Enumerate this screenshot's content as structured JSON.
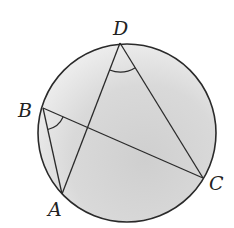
{
  "figure": {
    "type": "inscribed-angles",
    "circle": {
      "cx": 127,
      "cy": 133,
      "r": 89,
      "stroke": "#2a2a2a",
      "fill_shaded": "#d6d6d6",
      "fill_light": "#eeeeee"
    },
    "points": [
      {
        "id": "D",
        "label": "D",
        "x": 120,
        "y": 43,
        "lx": 113,
        "ly": 35
      },
      {
        "id": "B",
        "label": "B",
        "x": 43,
        "y": 108,
        "lx": 18,
        "ly": 117
      },
      {
        "id": "A",
        "label": "A",
        "x": 62,
        "y": 194,
        "lx": 48,
        "ly": 216
      },
      {
        "id": "C",
        "label": "C",
        "x": 203,
        "y": 178,
        "lx": 209,
        "ly": 190
      }
    ],
    "segments": [
      {
        "from": "D",
        "to": "A"
      },
      {
        "from": "D",
        "to": "C"
      },
      {
        "from": "B",
        "to": "A"
      },
      {
        "from": "B",
        "to": "C"
      }
    ],
    "angle_marks": [
      {
        "vertex": "D",
        "between": [
          "A",
          "C"
        ]
      },
      {
        "vertex": "B",
        "between": [
          "A",
          "C"
        ]
      }
    ]
  }
}
